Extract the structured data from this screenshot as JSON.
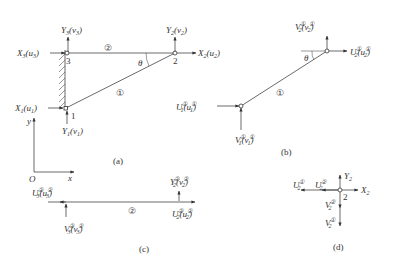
{
  "figure": {
    "panels": {
      "a": {
        "caption": "(a)",
        "nodes": [
          {
            "id": "1",
            "label": "1"
          },
          {
            "id": "2",
            "label": "2"
          },
          {
            "id": "3",
            "label": "3"
          }
        ],
        "members": [
          {
            "id": "1",
            "label": "①",
            "from": "1",
            "to": "2"
          },
          {
            "id": "2",
            "label": "②",
            "from": "3",
            "to": "2"
          }
        ],
        "angle_label": "θ",
        "forces": {
          "X3": {
            "main": "X",
            "sub": "3",
            "paren": "u",
            "psub": "3"
          },
          "Y3": {
            "main": "Y",
            "sub": "3",
            "paren": "v",
            "psub": "3"
          },
          "X2": {
            "main": "X",
            "sub": "2",
            "paren": "u",
            "psub": "2"
          },
          "Y2": {
            "main": "Y",
            "sub": "2",
            "paren": "v",
            "psub": "2"
          },
          "X1": {
            "main": "X",
            "sub": "1",
            "paren": "u",
            "psub": "1"
          },
          "Y1": {
            "main": "Y",
            "sub": "1",
            "paren": "v",
            "psub": "1"
          }
        },
        "axes": {
          "origin": "O",
          "x": "x",
          "y": "y"
        }
      },
      "b": {
        "caption": "(b)",
        "member_label": "①",
        "angle_label": "θ",
        "element_sup": "①",
        "forces": {
          "V2": {
            "main": "V",
            "sub": "2",
            "paren": "v",
            "psub": "2"
          },
          "U2": {
            "main": "U",
            "sub": "2",
            "paren": "u",
            "psub": "2"
          },
          "U1": {
            "main": "U",
            "sub": "1",
            "paren": "u",
            "psub": "1"
          },
          "V1": {
            "main": "V",
            "sub": "1",
            "paren": "v",
            "psub": "1"
          }
        }
      },
      "c": {
        "caption": "(c)",
        "member_label": "②",
        "element_sup": "②",
        "forces": {
          "U3": {
            "main": "U",
            "sub": "3",
            "paren": "u",
            "psub": "3"
          },
          "V3": {
            "main": "V",
            "sub": "3",
            "paren": "v",
            "psub": "3"
          },
          "Y2": {
            "main": "Y",
            "sub": "2",
            "paren": "v",
            "psub": "2"
          },
          "U2": {
            "main": "U",
            "sub": "2",
            "paren": "u",
            "psub": "2"
          }
        }
      },
      "d": {
        "caption": "(d)",
        "node_label": "2",
        "forces": {
          "U2_1": {
            "main": "U",
            "sub": "2",
            "sup": "①"
          },
          "U2_2": {
            "main": "U",
            "sub": "2",
            "sup": "②"
          },
          "Y2": {
            "main": "Y",
            "sub": "2"
          },
          "X2": {
            "main": "X",
            "sub": "2"
          },
          "V2_2": {
            "main": "V",
            "sub": "2",
            "sup": "②"
          },
          "V2_1": {
            "main": "V",
            "sub": "2",
            "sup": "①"
          }
        }
      }
    },
    "colors": {
      "ink": "#333333",
      "background": "#ffffff"
    }
  }
}
